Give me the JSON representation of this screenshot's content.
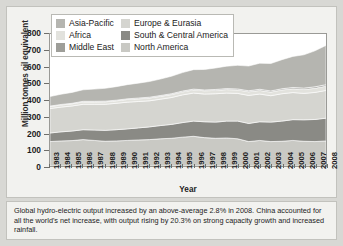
{
  "chart_data": {
    "type": "area",
    "stacked": true,
    "title": "",
    "xlabel": "Year",
    "ylabel": "Million tonnes oil equivalent",
    "ylim": [
      0,
      800
    ],
    "yticks": [
      0,
      100,
      200,
      300,
      400,
      500,
      600,
      700,
      800
    ],
    "grid": false,
    "legend_position": "top-left",
    "categories": [
      "1983",
      "1984",
      "1985",
      "1986",
      "1987",
      "1988",
      "1989",
      "1990",
      "1991",
      "1992",
      "1993",
      "1994",
      "1995",
      "1996",
      "1997",
      "1998",
      "1999",
      "2000",
      "2001",
      "2002",
      "2003",
      "2004",
      "2005",
      "2006",
      "2007",
      "2008"
    ],
    "series": [
      {
        "name": "North America",
        "color": "#c9c9c4",
        "values": [
          148,
          152,
          154,
          160,
          155,
          150,
          152,
          155,
          158,
          160,
          165,
          168,
          175,
          180,
          172,
          168,
          170,
          165,
          148,
          155,
          148,
          150,
          155,
          150,
          148,
          152
        ]
      },
      {
        "name": "South & Central America",
        "color": "#8a8a85",
        "values": [
          52,
          55,
          58,
          60,
          63,
          66,
          68,
          70,
          73,
          77,
          80,
          84,
          88,
          92,
          96,
          98,
          102,
          107,
          110,
          113,
          118,
          122,
          126,
          130,
          134,
          138
        ]
      },
      {
        "name": "Europe & Eurasia",
        "color": "#d5d5d0",
        "values": [
          148,
          150,
          152,
          154,
          156,
          158,
          160,
          162,
          160,
          158,
          160,
          163,
          168,
          170,
          168,
          172,
          170,
          168,
          170,
          168,
          160,
          166,
          164,
          160,
          164,
          168
        ]
      },
      {
        "name": "Africa",
        "color": "#e2e2dd",
        "values": [
          12,
          13,
          13,
          14,
          14,
          15,
          15,
          16,
          16,
          17,
          17,
          18,
          18,
          19,
          20,
          20,
          21,
          21,
          22,
          22,
          22,
          23,
          23,
          24,
          25,
          26
        ]
      },
      {
        "name": "Middle East",
        "color": "#9e9e99",
        "values": [
          3,
          3,
          3,
          4,
          4,
          4,
          4,
          4,
          5,
          5,
          5,
          5,
          5,
          5,
          5,
          6,
          6,
          6,
          6,
          7,
          7,
          7,
          8,
          8,
          9,
          9
        ]
      },
      {
        "name": "Asia-Pacific",
        "color": "#b5b5b0",
        "values": [
          58,
          62,
          66,
          70,
          74,
          78,
          82,
          86,
          90,
          95,
          100,
          106,
          112,
          118,
          124,
          130,
          136,
          143,
          150,
          158,
          166,
          176,
          188,
          202,
          218,
          238
        ]
      }
    ]
  },
  "legend": {
    "items": [
      {
        "label": "Asia-Pacific",
        "color": "#b5b5b0"
      },
      {
        "label": "Europe & Eurasia",
        "color": "#d5d5d0"
      },
      {
        "label": "Africa",
        "color": "#e2e2dd"
      },
      {
        "label": "South & Central America",
        "color": "#8a8a85"
      },
      {
        "label": "Middle East",
        "color": "#9e9e99"
      },
      {
        "label": "North America",
        "color": "#c9c9c4"
      }
    ]
  },
  "caption": {
    "text": "Global hydro-electric output increased by an above-average 2.8% in 2008. China accounted for all the world's net increase, with output rising by 20.3% on strong capacity growth and increased rainfall."
  },
  "colors": {
    "panel_bg": "#f2f2ef",
    "page_bg": "#d8d8d4",
    "plot_bg": "#ffffff",
    "axis": "#9a9a96",
    "text": "#1d1d1d"
  }
}
